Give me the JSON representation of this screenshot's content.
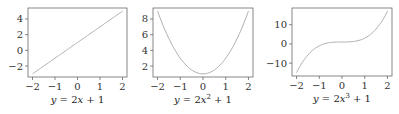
{
  "chart_data": [
    {
      "type": "line",
      "title": "y = 2x + 1",
      "title_parts": {
        "lhs": "y",
        "eq": " = 2",
        "var": "x",
        "sup": "",
        "rest": " + 1"
      },
      "xlabel": "",
      "ylabel": "",
      "x": [
        -2,
        -1,
        0,
        1,
        2
      ],
      "series": [
        {
          "name": "y = 2x + 1",
          "values": [
            -3,
            -1,
            1,
            3,
            5
          ]
        }
      ],
      "xlim": [
        -2.2,
        2.2
      ],
      "ylim": [
        -3.4,
        5.4
      ],
      "xticks": [
        -2,
        -1,
        0,
        1,
        2
      ],
      "xtick_labels": [
        "−2",
        "−1",
        "0",
        "1",
        "2"
      ],
      "yticks": [
        -2,
        0,
        2,
        4
      ],
      "ytick_labels": [
        "−2",
        "0",
        "2",
        "4"
      ],
      "grid": false,
      "line_color": "#a6a6a6",
      "frame": {
        "x": 28,
        "y": 8,
        "w": 99,
        "h": 69
      }
    },
    {
      "type": "line",
      "title": "y = 2x² + 1",
      "title_parts": {
        "lhs": "y",
        "eq": " = 2",
        "var": "x",
        "sup": "2",
        "rest": " + 1"
      },
      "xlabel": "",
      "ylabel": "",
      "x": [
        -2,
        -1.5,
        -1,
        -0.5,
        0,
        0.5,
        1,
        1.5,
        2
      ],
      "series": [
        {
          "name": "y = 2x² + 1",
          "values": [
            9,
            5.5,
            3,
            1.5,
            1,
            1.5,
            3,
            5.5,
            9
          ]
        }
      ],
      "xlim": [
        -2.2,
        2.2
      ],
      "ylim": [
        0.6,
        9.4
      ],
      "xticks": [
        -2,
        -1,
        0,
        1,
        2
      ],
      "xtick_labels": [
        "−2",
        "−1",
        "0",
        "1",
        "2"
      ],
      "yticks": [
        2,
        4,
        6,
        8
      ],
      "ytick_labels": [
        "2",
        "4",
        "6",
        "8"
      ],
      "grid": false,
      "line_color": "#a6a6a6",
      "frame": {
        "x": 153,
        "y": 8,
        "w": 100,
        "h": 69
      }
    },
    {
      "type": "line",
      "title": "y = 2x³ + 1",
      "title_parts": {
        "lhs": "y",
        "eq": " = 2",
        "var": "x",
        "sup": "3",
        "rest": " + 1"
      },
      "xlabel": "",
      "ylabel": "",
      "x": [
        -2,
        -1.5,
        -1,
        -0.5,
        0,
        0.5,
        1,
        1.5,
        2
      ],
      "series": [
        {
          "name": "y = 2x³ + 1",
          "values": [
            -15,
            -5.75,
            -1,
            0.75,
            1,
            1.25,
            3,
            7.75,
            17
          ]
        }
      ],
      "xlim": [
        -2.2,
        2.2
      ],
      "ylim": [
        -16.7,
        18.7
      ],
      "xticks": [
        -2,
        -1,
        0,
        1,
        2
      ],
      "xtick_labels": [
        "−2",
        "−1",
        "0",
        "1",
        "2"
      ],
      "yticks": [
        -10,
        0,
        10
      ],
      "ytick_labels": [
        "−10",
        "0",
        "10"
      ],
      "grid": false,
      "line_color": "#a6a6a6",
      "frame": {
        "x": 292,
        "y": 8,
        "w": 100,
        "h": 68
      }
    }
  ]
}
